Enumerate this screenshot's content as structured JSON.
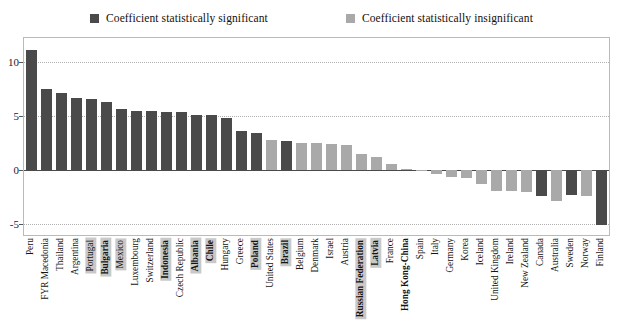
{
  "legend": {
    "items": [
      {
        "label": "Coefficient statistically significant",
        "color": "#4a4a4a",
        "name": "legend-significant"
      },
      {
        "label": "Coefficient statistically insignificant",
        "color": "#a9a9a9",
        "name": "legend-insignificant"
      }
    ]
  },
  "colors": {
    "significant": "#4a4a4a",
    "insignificant": "#a9a9a9",
    "frame": "#b9b9c6",
    "grid": "#b0b0b0",
    "zero_line": "#4a4a4a",
    "label_highlight": "#c9c9c9"
  },
  "chart_data": {
    "type": "bar",
    "title": "",
    "xlabel": "",
    "ylabel": "",
    "ylim": [
      -6.0,
      12.2
    ],
    "yticks": [
      10,
      5,
      0,
      -5
    ],
    "ytick_labels": [
      "10",
      "5",
      "0",
      "-5"
    ],
    "grid": true,
    "legend_position": "top-center",
    "categories": [
      "Peru",
      "FYR Macedonia",
      "Thailand",
      "Argentina",
      "Portugal",
      "Bulgaria",
      "Mexico",
      "Luxembourg",
      "Switzerland",
      "Indonesia",
      "Czech Republic",
      "Albania",
      "Chile",
      "Hungary",
      "Greece",
      "Poland",
      "United States",
      "Brazil",
      "Belgium",
      "Denmark",
      "Israel",
      "Austria",
      "Russian Federation",
      "Latvia",
      "France",
      "Hong Kong-China",
      "Spain",
      "Italy",
      "Germany",
      "Korea",
      "Iceland",
      "United Kingdom",
      "Ireland",
      "New Zealand",
      "Canada",
      "Australia",
      "Sweden",
      "Norway",
      "Finland"
    ],
    "values": [
      11.1,
      7.5,
      7.1,
      6.7,
      6.6,
      6.3,
      5.6,
      5.5,
      5.5,
      5.4,
      5.4,
      5.1,
      5.1,
      4.8,
      3.6,
      3.4,
      2.8,
      2.7,
      2.5,
      2.5,
      2.4,
      2.3,
      1.5,
      1.2,
      0.6,
      0.1,
      -0.1,
      -0.4,
      -0.6,
      -0.7,
      -1.3,
      -1.9,
      -1.9,
      -2.0,
      -2.4,
      -2.9,
      -2.3,
      -2.4,
      -5.1
    ],
    "significance": [
      "significant",
      "significant",
      "significant",
      "significant",
      "significant",
      "significant",
      "significant",
      "significant",
      "significant",
      "significant",
      "significant",
      "significant",
      "significant",
      "significant",
      "significant",
      "significant",
      "insignificant",
      "significant",
      "insignificant",
      "insignificant",
      "insignificant",
      "insignificant",
      "insignificant",
      "insignificant",
      "insignificant",
      "insignificant",
      "insignificant",
      "insignificant",
      "insignificant",
      "insignificant",
      "insignificant",
      "insignificant",
      "insignificant",
      "insignificant",
      "significant",
      "insignificant",
      "significant",
      "insignificant",
      "significant"
    ],
    "label_highlight": [
      false,
      false,
      false,
      false,
      true,
      true,
      true,
      false,
      false,
      true,
      false,
      true,
      true,
      false,
      false,
      true,
      false,
      true,
      false,
      false,
      false,
      false,
      true,
      true,
      false,
      false,
      false,
      false,
      false,
      false,
      false,
      false,
      false,
      false,
      false,
      false,
      false,
      false,
      false
    ],
    "label_bold": [
      false,
      false,
      false,
      false,
      false,
      true,
      false,
      false,
      false,
      true,
      false,
      true,
      true,
      false,
      false,
      true,
      false,
      true,
      false,
      false,
      false,
      false,
      true,
      true,
      false,
      true,
      false,
      false,
      false,
      false,
      false,
      false,
      false,
      false,
      false,
      false,
      false,
      false,
      false
    ]
  }
}
